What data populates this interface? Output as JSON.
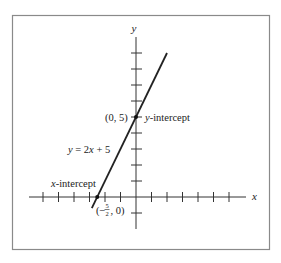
{
  "chart_data": {
    "type": "line",
    "title": "",
    "xlabel": "x",
    "ylabel": "y",
    "equation": "y = 2x + 5",
    "series": [
      {
        "name": "y = 2x + 5",
        "x": [
          -2.85,
          2.0
        ],
        "y": [
          -0.7,
          9.0
        ]
      }
    ],
    "points": [
      {
        "label": "(0, 5)",
        "x": 0,
        "y": 5,
        "annotation": "y-intercept"
      },
      {
        "label": "(-5/2, 0)",
        "x": -2.5,
        "y": 0,
        "annotation": "x-intercept"
      }
    ],
    "xlim": [
      -7,
      7
    ],
    "ylim": [
      -2,
      10
    ],
    "x_ticks": [
      -6,
      -5,
      -4,
      -3,
      -2,
      -1,
      1,
      2,
      3,
      4,
      5,
      6
    ],
    "y_ticks": [
      -1,
      1,
      2,
      3,
      4,
      5,
      6,
      7,
      8,
      9
    ],
    "tick_labels_shown": false,
    "grid": false,
    "legend": "none"
  },
  "labels": {
    "x_axis": "x",
    "y_axis": "y",
    "equation": "y = 2x + 5",
    "y_intercept_point": "(0, 5)",
    "y_intercept_text": "y-intercept",
    "x_intercept_text": "x-intercept",
    "x_intercept_point_open": "(−",
    "x_intercept_frac_num": "5",
    "x_intercept_frac_den": "2",
    "x_intercept_point_close": ", 0)"
  },
  "colors": {
    "line": "#222222",
    "axes": "#333333",
    "frame": "#888888"
  }
}
